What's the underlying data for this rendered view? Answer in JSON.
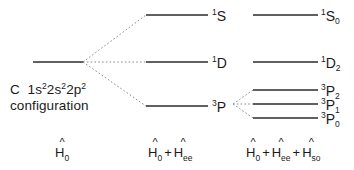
{
  "diagram": {
    "background_color": "#ffffff",
    "line_color": "#2b2b2b",
    "dotted_color": "#8a8a8a"
  },
  "configuration": {
    "element": "C",
    "notation_parts": [
      {
        "text": "1s",
        "sup": "2"
      },
      {
        "text": "2s",
        "sup": "2"
      },
      {
        "text": "2p",
        "sup": "2"
      }
    ],
    "line1": "C  1s²2s²2p²",
    "line2": "configuration"
  },
  "columns": [
    {
      "id": "h0",
      "hamiltonian": {
        "terms": [
          {
            "symbol": "H",
            "hat": "^",
            "sub": "0"
          }
        ],
        "plain": "Ĥ₀"
      }
    },
    {
      "id": "h0-hee",
      "hamiltonian": {
        "terms": [
          {
            "symbol": "H",
            "hat": "^",
            "sub": "0"
          },
          {
            "symbol": "H",
            "hat": "^",
            "sub": "ee"
          }
        ],
        "operator": "+",
        "plain": "Ĥ₀ + Ĥee"
      }
    },
    {
      "id": "h0-hee-hso",
      "hamiltonian": {
        "terms": [
          {
            "symbol": "H",
            "hat": "^",
            "sub": "0"
          },
          {
            "symbol": "H",
            "hat": "^",
            "sub": "ee"
          },
          {
            "symbol": "H",
            "hat": "^",
            "sub": "so"
          }
        ],
        "operator": "+",
        "plain": "Ĥ₀ + Ĥee + Ĥso"
      }
    }
  ],
  "levels": {
    "base": {
      "label": "",
      "x1": 33,
      "x2": 83,
      "y": 62
    },
    "ls_coupling": [
      {
        "id": "1S",
        "pre": "1",
        "letter": "S",
        "post": "",
        "x1": 146,
        "x2": 208,
        "y": 15,
        "label_x": 212,
        "label_y": 8
      },
      {
        "id": "1D",
        "pre": "1",
        "letter": "D",
        "post": "",
        "x1": 146,
        "x2": 208,
        "y": 62,
        "label_x": 212,
        "label_y": 55
      },
      {
        "id": "3P",
        "pre": "3",
        "letter": "P",
        "post": "",
        "x1": 146,
        "x2": 208,
        "y": 106,
        "label_x": 212,
        "label_y": 99
      }
    ],
    "fine_structure": [
      {
        "id": "1S0",
        "pre": "1",
        "letter": "S",
        "post": "0",
        "x1": 253,
        "x2": 318,
        "y": 15,
        "label_x": 321,
        "label_y": 8
      },
      {
        "id": "1D2",
        "pre": "1",
        "letter": "D",
        "post": "2",
        "x1": 253,
        "x2": 318,
        "y": 62,
        "label_x": 321,
        "label_y": 55
      },
      {
        "id": "3P2",
        "pre": "3",
        "letter": "P",
        "post": "2",
        "x1": 253,
        "x2": 318,
        "y": 90,
        "label_x": 321,
        "label_y": 83
      },
      {
        "id": "3P1",
        "pre": "3",
        "letter": "P",
        "post": "1",
        "x1": 253,
        "x2": 318,
        "y": 104,
        "label_x": 321,
        "label_y": 97
      },
      {
        "id": "3P0",
        "pre": "3",
        "letter": "P",
        "post": "0",
        "x1": 253,
        "x2": 318,
        "y": 118,
        "label_x": 321,
        "label_y": 111
      }
    ]
  },
  "connectors": {
    "primary_origin": {
      "x": 83,
      "y": 62
    },
    "primary_targets": [
      {
        "x": 146,
        "y": 15
      },
      {
        "x": 146,
        "y": 62
      },
      {
        "x": 146,
        "y": 106
      }
    ],
    "secondary_origin": {
      "x": 233,
      "y": 104
    },
    "secondary_targets": [
      {
        "x": 253,
        "y": 90
      },
      {
        "x": 253,
        "y": 104
      },
      {
        "x": 253,
        "y": 118
      }
    ]
  },
  "hamiltonian_positions": [
    {
      "id": "h0",
      "x": 55,
      "y": 146
    },
    {
      "id": "h0-hee",
      "x": 148,
      "y": 146
    },
    {
      "id": "h0-hee-hso",
      "x": 246,
      "y": 146
    }
  ]
}
